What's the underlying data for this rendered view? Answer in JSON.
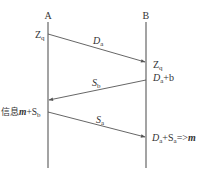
{
  "participants": {
    "a": {
      "label": "A"
    },
    "b": {
      "label": "B"
    }
  },
  "messages": [
    {
      "label": "D",
      "sub": "a",
      "from": "A",
      "to": "B"
    },
    {
      "label": "S",
      "sub": "b",
      "from": "B",
      "to": "A"
    },
    {
      "label": "S",
      "sub": "a",
      "from": "A",
      "to": "B"
    }
  ],
  "annotations": {
    "a_zq": {
      "main": "Z",
      "sub": "q"
    },
    "b_zq": {
      "main": "Z",
      "sub": "q"
    },
    "b_da_b": {
      "main": "D",
      "sub": "a",
      "rest": "+b"
    },
    "a_msg": {
      "prefix": "信息",
      "m": "m",
      "plus": "+S",
      "sub": "b"
    },
    "b_result": {
      "d": "D",
      "dsub": "a",
      "plus": "+S",
      "ssub": "a",
      "arrow": "=>",
      "m": "m"
    }
  }
}
